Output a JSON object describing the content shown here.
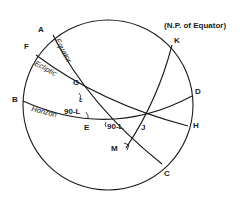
{
  "diagram": {
    "title_note": "(N.P. of Equator)",
    "points": {
      "A": "A",
      "B": "B",
      "C": "C",
      "D": "D",
      "E": "E",
      "F": "F",
      "G": "G",
      "H": "H",
      "J": "J",
      "K": "K",
      "M": "M"
    },
    "curves": {
      "equator": "Equator",
      "ecliptic": "Ecliptic",
      "horizon": "Horizon"
    },
    "angles": {
      "obliquity": "ε",
      "angle_at_E": "90-L",
      "angle_at_equator_horizon": "90-L"
    }
  }
}
